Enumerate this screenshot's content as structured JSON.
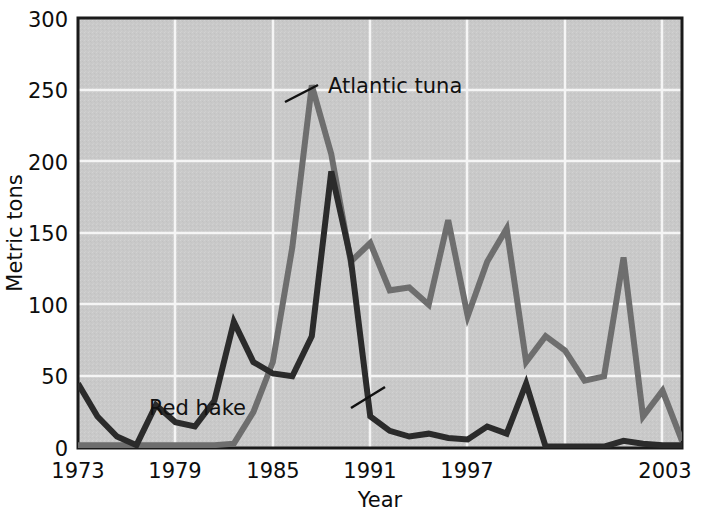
{
  "chart_data": {
    "type": "line",
    "title": "",
    "xlabel": "Year",
    "ylabel": "Metric tons",
    "xlim": [
      1973,
      2004
    ],
    "ylim": [
      0,
      300
    ],
    "grid": true,
    "legend_position": "inline-annotations",
    "xticks": [
      "1973",
      "1979",
      "1985",
      "1991",
      "1997",
      "2003"
    ],
    "xtick_values": [
      1973,
      1979,
      1985,
      1991,
      1997,
      2003
    ],
    "yticks": [
      "0",
      "50",
      "100",
      "150",
      "200",
      "250",
      "300"
    ],
    "ytick_values": [
      0,
      50,
      100,
      150,
      200,
      250,
      300
    ],
    "x": [
      1973,
      1974,
      1975,
      1976,
      1977,
      1978,
      1979,
      1980,
      1981,
      1982,
      1983,
      1984,
      1985,
      1986,
      1987,
      1988,
      1989,
      1990,
      1991,
      1992,
      1993,
      1994,
      1995,
      1996,
      1997,
      1998,
      1999,
      2000,
      2001,
      2002,
      2003,
      2004
    ],
    "series": [
      {
        "name": "Atlantic tuna",
        "color": "#6e6e6e",
        "values": [
          2,
          2,
          2,
          2,
          2,
          2,
          2,
          2,
          3,
          25,
          60,
          140,
          253,
          205,
          130,
          143,
          110,
          112,
          100,
          159,
          92,
          130,
          153,
          60,
          78,
          68,
          47,
          50,
          133,
          22,
          40,
          5
        ]
      },
      {
        "name": "Red hake",
        "color": "#2b2b2b",
        "values": [
          45,
          22,
          8,
          2,
          30,
          18,
          15,
          33,
          88,
          60,
          52,
          50,
          78,
          193,
          132,
          22,
          12,
          8,
          10,
          7,
          6,
          15,
          10,
          45,
          1,
          1,
          1,
          1,
          5,
          3,
          2,
          2
        ]
      }
    ],
    "annotations": [
      {
        "label": "Atlantic tuna",
        "label_x": 328,
        "label_y": 93,
        "leader_from_x": 318,
        "leader_from_y": 85,
        "leader_to_x": 285,
        "leader_to_y": 102
      },
      {
        "label": "Red hake",
        "label_x": 246,
        "label_y": 415,
        "leader_from_x": 351,
        "leader_from_y": 408,
        "leader_to_x": 385,
        "leader_to_y": 387
      }
    ],
    "colors": {
      "plot_background": "#c9c9c9",
      "grid_line": "#f5f5f5",
      "axis_line": "#1a1a1a",
      "text": "#0d0d0d",
      "atlantic_tuna": "#6e6e6e",
      "red_hake": "#2b2b2b"
    }
  }
}
